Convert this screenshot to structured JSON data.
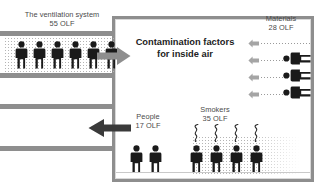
{
  "diagram": {
    "title_center": "Contamination factors\nfor inside air",
    "labels": {
      "ventilation": "The ventilation system\n55 OLF",
      "materials": "Materials\n28 OLF",
      "smokers": "Smokers\n35 OLF",
      "people": "People\n17 OLF"
    },
    "sources": [
      {
        "name": "The ventilation system",
        "value": 55,
        "unit": "OLF",
        "figures": 6,
        "position": "left-duct-inlet"
      },
      {
        "name": "Materials",
        "value": 28,
        "unit": "OLF",
        "figures": 4,
        "position": "right-wall"
      },
      {
        "name": "Smokers",
        "value": 35,
        "unit": "OLF",
        "figures": 4,
        "position": "bottom-right"
      },
      {
        "name": "People",
        "value": 17,
        "unit": "OLF",
        "figures": 2,
        "position": "bottom-left"
      }
    ],
    "arrows": [
      {
        "name": "inlet-airflow-arrow",
        "direction": "right"
      },
      {
        "name": "outlet-airflow-arrow",
        "direction": "left"
      },
      {
        "name": "materials-emission-arrow",
        "direction": "left",
        "count": 4
      }
    ],
    "colors": {
      "wall": "#8e8e8e",
      "figure": "#1a1a1a",
      "text": "#4a4a4a",
      "title_text": "#222222",
      "air_dots": "#b4b4b4",
      "background": "#ffffff"
    }
  }
}
